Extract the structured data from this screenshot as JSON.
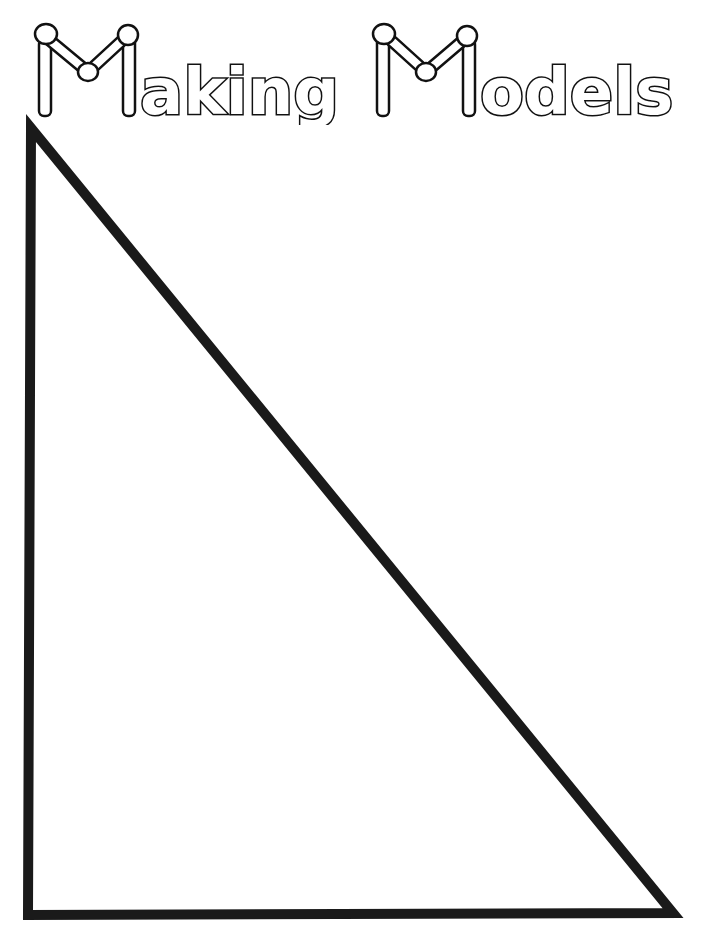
{
  "title": {
    "word1_rest": "aking",
    "word2_rest": "odels",
    "full_text": "Making Models",
    "cap_letter": "M"
  },
  "worksheet": {
    "shape": "right-triangle",
    "apex": [
      31,
      128
    ],
    "bottom_left": [
      28,
      915
    ],
    "bottom_right": [
      673,
      913
    ],
    "stroke_color": "#1a1a1a",
    "stroke_width": 10,
    "fill": "#ffffff"
  }
}
